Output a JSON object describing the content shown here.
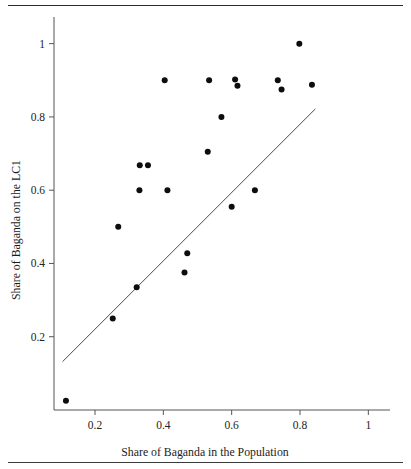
{
  "figure": {
    "has_top_rule": true,
    "has_bottom_rule": true,
    "background_color": "#ffffff"
  },
  "chart_data": {
    "type": "scatter",
    "title": "",
    "xlabel": "Share of Baganda in the Population",
    "ylabel": "Share of Baganda on the LC1",
    "xlim": [
      0.08,
      1.04
    ],
    "ylim": [
      0.0,
      1.04
    ],
    "grid": false,
    "legend": null,
    "xticks": [
      0.2,
      0.4,
      0.6,
      0.8,
      1
    ],
    "xtick_labels": [
      "0.2",
      "0.4",
      "0.6",
      "0.8",
      "1"
    ],
    "yticks": [
      0.2,
      0.4,
      0.6,
      0.8,
      1
    ],
    "ytick_labels": [
      "0.2",
      "0.4",
      "0.6",
      "0.8",
      "1"
    ],
    "point_color": "#0d0d0d",
    "point_radius": 3,
    "series": [
      {
        "name": "villages",
        "points": [
          [
            0.115,
            0.025
          ],
          [
            0.252,
            0.25
          ],
          [
            0.268,
            0.5
          ],
          [
            0.322,
            0.335
          ],
          [
            0.33,
            0.6
          ],
          [
            0.331,
            0.668
          ],
          [
            0.355,
            0.668
          ],
          [
            0.404,
            0.9
          ],
          [
            0.412,
            0.6
          ],
          [
            0.462,
            0.375
          ],
          [
            0.47,
            0.428
          ],
          [
            0.53,
            0.705
          ],
          [
            0.534,
            0.9
          ],
          [
            0.57,
            0.8
          ],
          [
            0.6,
            0.555
          ],
          [
            0.61,
            0.902
          ],
          [
            0.617,
            0.885
          ],
          [
            0.668,
            0.6
          ],
          [
            0.735,
            0.9
          ],
          [
            0.746,
            0.875
          ],
          [
            0.798,
            1.0
          ],
          [
            0.835,
            0.888
          ]
        ]
      }
    ],
    "fit_line": {
      "name": "45-degree reference / fitted line",
      "color": "#4a4a4a",
      "x_start": 0.105,
      "y_start": 0.132,
      "x_end": 0.845,
      "y_end": 0.822
    }
  }
}
